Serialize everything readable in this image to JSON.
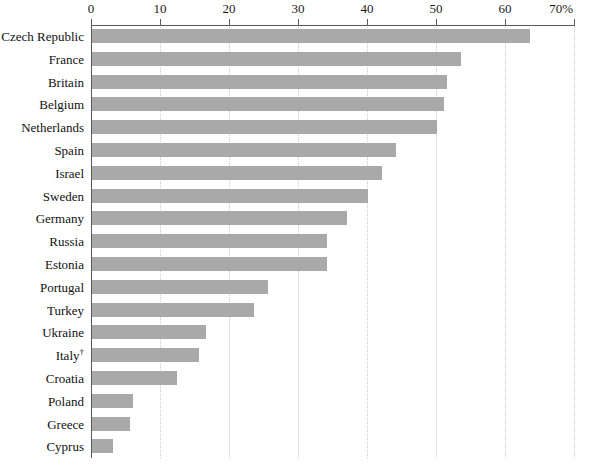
{
  "chart_data": {
    "type": "bar",
    "orientation": "horizontal",
    "title": "",
    "subtitle": "",
    "xlabel": "",
    "ylabel": "",
    "xlim": [
      0,
      70
    ],
    "xunit": "%",
    "grid": true,
    "legend": null,
    "xticks": [
      {
        "value": 0,
        "label": "0"
      },
      {
        "value": 10,
        "label": "10"
      },
      {
        "value": 20,
        "label": "20"
      },
      {
        "value": 30,
        "label": "30"
      },
      {
        "value": 40,
        "label": "40"
      },
      {
        "value": 50,
        "label": "50"
      },
      {
        "value": 60,
        "label": "60"
      },
      {
        "value": 70,
        "label": "70%"
      }
    ],
    "categories": [
      "Czech Republic",
      "France",
      "Britain",
      "Belgium",
      "Netherlands",
      "Spain",
      "Israel",
      "Sweden",
      "Germany",
      "Russia",
      "Estonia",
      "Portugal",
      "Turkey",
      "Ukraine",
      "Italy†",
      "Croatia",
      "Poland",
      "Greece",
      "Cyprus"
    ],
    "values": [
      63.5,
      53.5,
      51.5,
      51.0,
      50.0,
      44.0,
      42.0,
      40.0,
      37.0,
      34.0,
      34.0,
      25.5,
      23.5,
      16.5,
      15.5,
      12.3,
      6.0,
      5.5,
      3.0
    ],
    "bar_color": "#a9a9a9",
    "axis_color": "#55595c",
    "grid_color": "#c9c9c9",
    "footnote_marker": "†"
  }
}
